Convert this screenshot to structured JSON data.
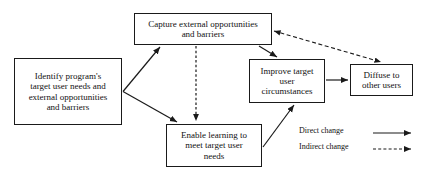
{
  "diagram": {
    "stroke_color": "#1a1a1a",
    "background_color": "#ffffff",
    "nodes": [
      {
        "id": "identify",
        "label": "Identify program's\ntarget user needs and\nexternal opportunities\nand barriers"
      },
      {
        "id": "capture",
        "label": "Capture external opportunities\nand barriers"
      },
      {
        "id": "enable",
        "label": "Enable learning to\nmeet target user\nneeds"
      },
      {
        "id": "improve",
        "label": "Improve target\nuser\ncircumstances"
      },
      {
        "id": "diffuse",
        "label": "Diffuse to\nother users"
      }
    ],
    "edges": [
      {
        "id": "identify-to-capture",
        "from": "identify",
        "to": "capture",
        "style": "direct"
      },
      {
        "id": "identify-to-enable",
        "from": "identify",
        "to": "enable",
        "style": "direct"
      },
      {
        "id": "capture-to-enable",
        "from": "capture",
        "to": "enable",
        "style": "indirect"
      },
      {
        "id": "capture-to-improve",
        "from": "capture",
        "to": "improve",
        "style": "direct"
      },
      {
        "id": "enable-to-improve",
        "from": "enable",
        "to": "improve",
        "style": "direct"
      },
      {
        "id": "improve-to-diffuse",
        "from": "improve",
        "to": "diffuse",
        "style": "direct"
      },
      {
        "id": "diffuse-capture-bidirectional",
        "from": "diffuse",
        "to": "capture",
        "style": "indirect",
        "bidirectional": true
      }
    ]
  },
  "legend": {
    "direct_label": "Direct change",
    "indirect_label": "Indirect change"
  }
}
